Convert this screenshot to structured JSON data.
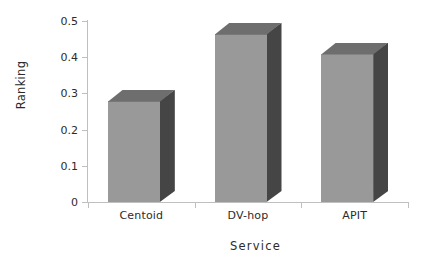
{
  "chart_data": {
    "type": "bar",
    "title": "",
    "subtitle": "",
    "xlabel": "Service",
    "ylabel": "Ranking",
    "categories": [
      "Centoid",
      "DV-hop",
      "APIT"
    ],
    "values": [
      0.28,
      0.465,
      0.41
    ],
    "series": [
      {
        "name": "Ranking",
        "values": [
          0.28,
          0.465,
          0.41
        ]
      }
    ],
    "ylim": [
      0,
      0.5
    ],
    "yticks": [
      0,
      0.1,
      0.2,
      0.3,
      0.4,
      0.5
    ],
    "ytick_labels": [
      "0",
      "0.1",
      "0.2",
      "0.3",
      "0.4",
      "0.5"
    ],
    "grid": false,
    "legend": false,
    "legend_position": "none",
    "style": "3d-column",
    "colors": {
      "bar_front": "#999999",
      "bar_side": "#454545",
      "bar_top": "#6e6e6e",
      "axis": "#bfbfbf",
      "text": "#2b2b2b",
      "background": "#ffffff"
    }
  },
  "axes": {
    "y_title": "Ranking",
    "x_title": "Service"
  },
  "ticks": {
    "y": [
      {
        "label": "0.5",
        "value": 0.5
      },
      {
        "label": "0.4",
        "value": 0.4
      },
      {
        "label": "0.3",
        "value": 0.3
      },
      {
        "label": "0.2",
        "value": 0.2
      },
      {
        "label": "0.1",
        "value": 0.1
      },
      {
        "label": "0",
        "value": 0.0
      }
    ]
  },
  "bars": [
    {
      "label": "Centoid",
      "value": 0.28
    },
    {
      "label": "DV-hop",
      "value": 0.465
    },
    {
      "label": "APIT",
      "value": 0.41
    }
  ]
}
